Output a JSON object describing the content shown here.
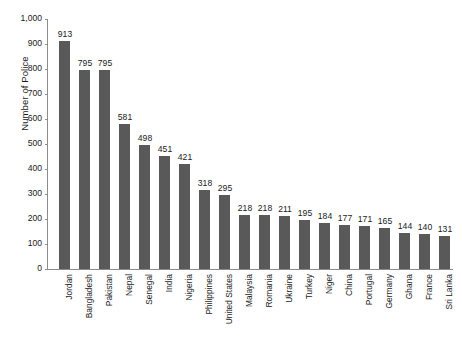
{
  "chart_data": {
    "type": "bar",
    "title": "",
    "subtitle": "",
    "xlabel": "",
    "ylabel": "Number of Police",
    "ylim": [
      0,
      1000
    ],
    "ytick_step": 100,
    "ytick_labels": [
      "0",
      "100",
      "200",
      "300",
      "400",
      "500",
      "600",
      "700",
      "800",
      "900",
      "1,000"
    ],
    "grid": false,
    "legend": false,
    "bar_color": "#595959",
    "axis_color": "#8c8c8c",
    "show_value_labels": true,
    "categories": [
      "Jordan",
      "Bangladesh",
      "Pakistan",
      "Nepal",
      "Senegal",
      "India",
      "Nigeria",
      "Philippines",
      "United States",
      "Malaysia",
      "Romania",
      "Ukraine",
      "Turkey",
      "Niger",
      "China",
      "Portugal",
      "Germany",
      "Ghana",
      "France",
      "Sri Lanka"
    ],
    "values": [
      913,
      795,
      795,
      581,
      498,
      451,
      421,
      318,
      295,
      218,
      218,
      211,
      195,
      184,
      177,
      171,
      165,
      144,
      140,
      131
    ],
    "value_labels": [
      "913",
      "795",
      "795",
      "581",
      "498",
      "451",
      "421",
      "318",
      "295",
      "218",
      "218",
      "211",
      "195",
      "184",
      "177",
      "171",
      "165",
      "144",
      "140",
      "131"
    ]
  }
}
